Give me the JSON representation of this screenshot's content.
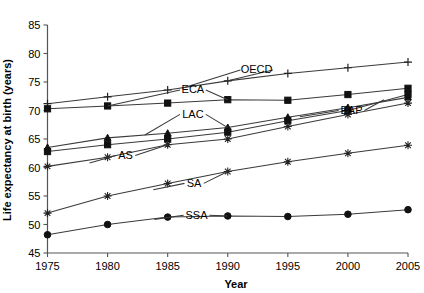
{
  "chart_data": {
    "type": "line",
    "title": "",
    "xlabel": "Year",
    "ylabel": "Life expectancy at birth (years)",
    "x": [
      1975,
      1980,
      1985,
      1990,
      1995,
      2000,
      2005
    ],
    "xlim": [
      1975,
      2005
    ],
    "ylim": [
      45,
      85
    ],
    "yticks": [
      45,
      50,
      55,
      60,
      65,
      70,
      75,
      80,
      85
    ],
    "xticks": [
      1975,
      1980,
      1985,
      1990,
      1995,
      2000,
      2005
    ],
    "grid": false,
    "legend": "inline-labels",
    "series": [
      {
        "name": "OECD",
        "marker": "plus",
        "label_x": 1992.4,
        "label_y": 76.5,
        "values": [
          71.2,
          72.4,
          73.6,
          75.2,
          76.5,
          77.5,
          78.5
        ]
      },
      {
        "name": "ECA",
        "marker": "square",
        "label_x": 1987.1,
        "label_y": 73.0,
        "values": [
          70.3,
          70.8,
          71.3,
          71.9,
          71.8,
          72.8,
          73.9
        ]
      },
      {
        "name": "LAC",
        "marker": "triangle",
        "label_x": 1987.1,
        "label_y": 68.7,
        "values": [
          63.5,
          65.2,
          66.0,
          67.0,
          68.8,
          70.5,
          72.3
        ]
      },
      {
        "name": "EAP",
        "marker": "square",
        "label_x": 2000.3,
        "label_y": 69.4,
        "values": [
          62.8,
          64.0,
          65.0,
          66.2,
          68.2,
          70.0,
          72.8
        ]
      },
      {
        "name": "AS",
        "marker": "star",
        "label_x": 1981.5,
        "label_y": 61.5,
        "values": [
          60.2,
          61.8,
          64.0,
          65.0,
          67.2,
          69.3,
          71.3
        ]
      },
      {
        "name": "SA",
        "marker": "star",
        "label_x": 1987.2,
        "label_y": 56.6,
        "values": [
          52.0,
          55.0,
          57.2,
          59.3,
          61.0,
          62.5,
          63.9
        ]
      },
      {
        "name": "SSA",
        "marker": "circle",
        "label_x": 1987.4,
        "label_y": 51.0,
        "values": [
          48.2,
          50.0,
          51.3,
          51.5,
          51.4,
          51.8,
          52.6
        ]
      }
    ],
    "label_leaders": [
      {
        "series": "OECD",
        "left_x": 1986.2,
        "left_y": 73.9,
        "right_x": 1990.0,
        "right_y": 75.2
      },
      {
        "series": "ECA",
        "left_x": 1980.0,
        "left_y": 70.8,
        "right_x": 1990.0,
        "right_y": 71.9
      },
      {
        "series": "LAC",
        "left_x": 1983.1,
        "left_y": 65.7,
        "right_x": 1990.0,
        "right_y": 67.0
      },
      {
        "series": "EAP",
        "left_x": 1996.0,
        "left_y": 68.9,
        "right_x": 2003.0,
        "right_y": 71.9
      },
      {
        "series": "AS",
        "left_x": 1978.5,
        "left_y": 60.8,
        "right_x": 1985.0,
        "right_y": 64.0
      },
      {
        "series": "SA",
        "left_x": 1983.8,
        "left_y": 56.1,
        "right_x": 1990.0,
        "right_y": 59.3
      },
      {
        "series": "SSA",
        "left_x": 1983.9,
        "left_y": 50.9,
        "right_x": 1990.0,
        "right_y": 51.5
      }
    ]
  }
}
